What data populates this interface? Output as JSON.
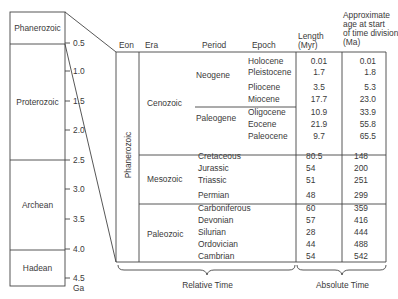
{
  "eon_column": {
    "eons": [
      {
        "name": "Phanerozoic"
      },
      {
        "name": "Proterozoic"
      },
      {
        "name": "Archean"
      },
      {
        "name": "Hadean"
      }
    ],
    "ticks": [
      "0.5",
      "1.0",
      "1.5",
      "2.0",
      "2.5",
      "3.0",
      "3.5",
      "4.0",
      "4.5"
    ],
    "unit": "Ga"
  },
  "table": {
    "headers": {
      "eon": "Eon",
      "era": "Era",
      "period": "Period",
      "epoch": "Epoch",
      "length": "Length\n(Myr)",
      "length_l1": "Length",
      "length_l2": "(Myr)",
      "age_l1": "Approximate",
      "age_l2": "age at start",
      "age_l3": "of time division",
      "age_l4": "(Ma)"
    },
    "eon": "Phanerozoic",
    "eras": [
      {
        "name": "Cenozoic"
      },
      {
        "name": "Mesozoic"
      },
      {
        "name": "Paleozoic"
      }
    ],
    "periods": [
      {
        "name": "Neogene"
      },
      {
        "name": "Paleogene"
      }
    ],
    "rows": [
      {
        "name": "Holocene",
        "length": "0.01",
        "age": "0.01"
      },
      {
        "name": "Pleistocene",
        "length": "1.7",
        "age": "1.8"
      },
      {
        "name": "Pliocene",
        "length": "3.5",
        "age": "5.3"
      },
      {
        "name": "Miocene",
        "length": "17.7",
        "age": "23.0"
      },
      {
        "name": "Oligocene",
        "length": "10.9",
        "age": "33.9"
      },
      {
        "name": "Eocene",
        "length": "21.9",
        "age": "55.8"
      },
      {
        "name": "Paleocene",
        "length": "9.7",
        "age": "65.5"
      },
      {
        "name": "Cretaceous",
        "length": "80.5",
        "age": "148"
      },
      {
        "name": "Jurassic",
        "length": "54",
        "age": "200"
      },
      {
        "name": "Triassic",
        "length": "51",
        "age": "251"
      },
      {
        "name": "Permian",
        "length": "48",
        "age": "299"
      },
      {
        "name": "Carboniferous",
        "length": "60",
        "age": "359"
      },
      {
        "name": "Devonian",
        "length": "57",
        "age": "416"
      },
      {
        "name": "Silurian",
        "length": "28",
        "age": "444"
      },
      {
        "name": "Ordovician",
        "length": "44",
        "age": "488"
      },
      {
        "name": "Cambrian",
        "length": "54",
        "age": "542"
      }
    ]
  },
  "braces": {
    "relative": "Relative Time",
    "absolute": "Absolute Time"
  }
}
